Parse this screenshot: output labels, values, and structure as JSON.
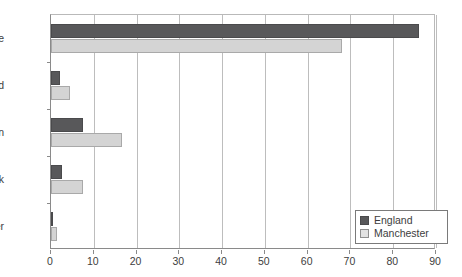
{
  "chart_data": {
    "type": "bar",
    "orientation": "horizontal",
    "title": "",
    "xlabel": "",
    "ylabel": "",
    "categories": [
      "White",
      "Mixed",
      "Asian",
      "Black",
      "Other"
    ],
    "series": [
      {
        "name": "England",
        "color": "#58585a",
        "values": [
          86,
          2,
          7.5,
          2.5,
          0.5
        ]
      },
      {
        "name": "Manchester",
        "color": "#d4d4d4",
        "values": [
          68,
          4.5,
          16.5,
          7.5,
          1.5
        ]
      }
    ],
    "xlim": [
      0,
      90
    ],
    "xticks": [
      0,
      10,
      20,
      30,
      40,
      50,
      60,
      70,
      80,
      90
    ],
    "xtick_labels": [
      "0",
      "10",
      "20",
      "30",
      "40",
      "50",
      "60",
      "70",
      "80",
      "90"
    ],
    "grid": "vertical",
    "legend_position": "bottom-right",
    "legend_entries": [
      "England",
      "Manchester"
    ]
  }
}
